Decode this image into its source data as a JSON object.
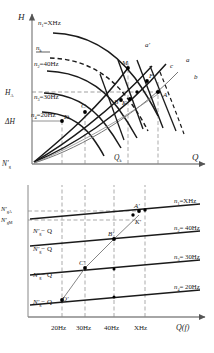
{
  "figure": {
    "type": "technical-diagram"
  },
  "upper_chart": {
    "y_axis_label": "H",
    "x_axis_label": "Q",
    "origin_label": "N'g",
    "y_ticks": [
      {
        "id": "HA",
        "label": "H",
        "sub": "A",
        "y": 92
      },
      {
        "id": "dH",
        "label": "ΔH",
        "sub": "",
        "y": 121
      }
    ],
    "x_ticks": [
      {
        "label": "Q",
        "sub": "k",
        "x": 120
      }
    ],
    "curves": [
      {
        "id": "n1",
        "label": "n",
        "sub": "1",
        "eq": "=XHz",
        "dashed": false
      },
      {
        "id": "nk",
        "label": "n",
        "sub": "k",
        "eq": "",
        "dashed": true
      },
      {
        "id": "n2",
        "label": "n",
        "sub": "2",
        "eq": "=40Hz",
        "dashed": false
      },
      {
        "id": "n3",
        "label": "n",
        "sub": "3",
        "eq": "=30Hz",
        "dashed": false
      },
      {
        "id": "n4",
        "label": "n",
        "sub": "4",
        "eq": "=20Hz",
        "dashed": false
      }
    ],
    "system_lines": [
      {
        "id": "a-prime",
        "label": "a'"
      },
      {
        "id": "c",
        "label": "c"
      },
      {
        "id": "a",
        "label": "a"
      },
      {
        "id": "b",
        "label": "b"
      }
    ],
    "points": [
      {
        "id": "M",
        "label": "M",
        "x": 128,
        "y": 68
      },
      {
        "id": "F",
        "label": "F",
        "x": 148,
        "y": 81
      },
      {
        "id": "A",
        "label": "A",
        "x": 158,
        "y": 94
      },
      {
        "id": "B",
        "label": "B",
        "x": 122,
        "y": 99
      },
      {
        "id": "K",
        "label": "K",
        "x": 131,
        "y": 98
      },
      {
        "id": "C",
        "label": "C",
        "x": 85,
        "y": 112
      },
      {
        "id": "D",
        "label": "D",
        "x": 62,
        "y": 120
      }
    ]
  },
  "lower_chart": {
    "x_axis_label": "Q(f)",
    "y_ticks": [
      {
        "id": "NgA",
        "label": "N'",
        "sub": "gA"
      },
      {
        "id": "NgM",
        "label": "N'",
        "sub": "gM"
      }
    ],
    "x_ticks": [
      "20Hz",
      "30Hz",
      "40Hz",
      "XHz"
    ],
    "lines": [
      {
        "id": "L1",
        "inner_label": "N'",
        "inner_sub": "g",
        "inner_tail": "− Q",
        "right_label": "n",
        "right_sub": "1",
        "right_eq": "=XHz"
      },
      {
        "id": "L2",
        "inner_label": "N'",
        "inner_sub": "g",
        "inner_tail": "− Q",
        "right_label": "n",
        "right_sub": "2",
        "right_eq": "= 40Hz"
      },
      {
        "id": "L3",
        "inner_label": "N'",
        "inner_sub": "g",
        "inner_tail": "− Q",
        "right_label": "n",
        "right_sub": "3",
        "right_eq": "= 30Hz"
      },
      {
        "id": "L4",
        "inner_label": "N'",
        "inner_sub": "g",
        "inner_tail": "− Q",
        "right_label": "n",
        "right_sub": "4",
        "right_eq": "= 20Hz"
      }
    ],
    "points": [
      {
        "id": "Aprime",
        "label": "A'"
      },
      {
        "id": "Kprime",
        "label": "K'"
      },
      {
        "id": "Bprime",
        "label": "B'"
      },
      {
        "id": "Cprime",
        "label": "C'"
      },
      {
        "id": "Dprime",
        "label": "D'"
      }
    ]
  }
}
